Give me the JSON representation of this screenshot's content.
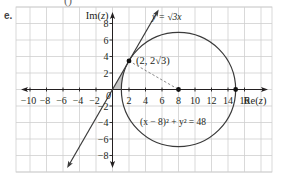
{
  "part_label": "e.",
  "cropped_top_fragment": [
    "(",
    ")"
  ],
  "chart_data": {
    "type": "line",
    "title": "",
    "xlabel": "Re(z)",
    "ylabel": "Im(z)",
    "xlim": [
      -12,
      19
    ],
    "ylim": [
      -10,
      10
    ],
    "grid": true,
    "x_ticks": [
      -10,
      -8,
      -6,
      -4,
      -2,
      0,
      2,
      4,
      6,
      8,
      10,
      12,
      14,
      16
    ],
    "x_tick_labels": [
      "−10",
      "−8",
      "−6",
      "−4",
      "−2",
      "0",
      "2",
      "4",
      "6",
      "8",
      "10",
      "12",
      "14",
      "16"
    ],
    "y_ticks": [
      8,
      6,
      4,
      2,
      -2,
      -4,
      -6,
      -8
    ],
    "y_tick_labels": [
      "8",
      "6",
      "4",
      "2",
      "−2",
      "−4",
      "−6",
      "−8"
    ],
    "series": [
      {
        "name": "y = √3x",
        "kind": "line",
        "equation": "y = sqrt(3) x",
        "x": [
          -5.5,
          5.6
        ],
        "y": [
          -9.53,
          9.7
        ],
        "arrows": "both"
      },
      {
        "name": "(x − 8)² + y² = 48",
        "kind": "circle",
        "center": [
          8,
          0
        ],
        "radius": 6.928
      }
    ],
    "points": [
      {
        "label": "(2, 2√3)",
        "x": 2,
        "y": 3.464
      },
      {
        "label": "",
        "x": 8,
        "y": 0
      },
      {
        "label": "",
        "x": 14.93,
        "y": 0
      }
    ],
    "dashed_segments": [
      {
        "from": [
          2,
          3.464
        ],
        "to": [
          8,
          0
        ]
      }
    ],
    "shaded_region": {
      "description": "region bounded by the line y = √3x, the real axis and the circle near the origin",
      "color": "#c8c8c8"
    },
    "annotations": [
      {
        "text": "y = √3x",
        "x": 6.5,
        "y": 8.1
      },
      {
        "text": "(2, 2√3)",
        "x": 2.6,
        "y": 3.5
      },
      {
        "text": "(x − 8)² + y² = 48",
        "x": 3.4,
        "y": -4.1
      }
    ],
    "legend": "none"
  },
  "labels": {
    "y_axis": "Im(z)",
    "x_axis": "Re(z)",
    "line_eq": "y = √3x",
    "point": "(2, 2√3)",
    "circle_eq": "(x − 8)² + y² = 48",
    "origin": "0"
  },
  "colors": {
    "grid": "#cfcfcf",
    "axis": "#231f20",
    "curve": "#3a3a3a",
    "dashed": "#6d6d6d",
    "shade": "#c8c8c8",
    "text": "#231f20"
  }
}
